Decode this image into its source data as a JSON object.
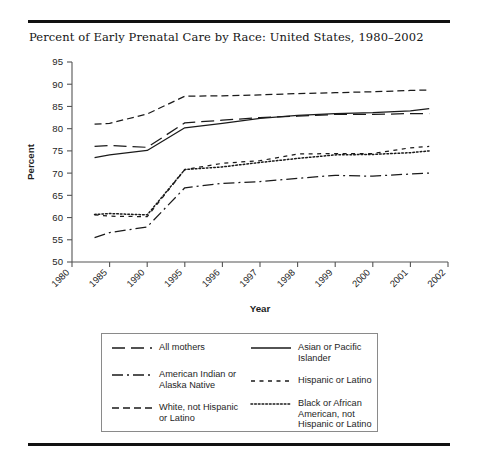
{
  "figure": {
    "title": "Percent of Early Prenatal Care by Race: United States, 1980–2002"
  },
  "chart_data": {
    "type": "line",
    "title": "Percent of Early Prenatal Care by Race: United States, 1980–2002",
    "xlabel": "Year",
    "ylabel": "Percent",
    "ylim": [
      50,
      95
    ],
    "ytick_labels": [
      "50",
      "55",
      "60",
      "65",
      "70",
      "75",
      "80",
      "85",
      "90",
      "95"
    ],
    "yticks": [
      50,
      55,
      60,
      65,
      70,
      75,
      80,
      85,
      90,
      95
    ],
    "categories": [
      "1980",
      "1985",
      "1990",
      "1995",
      "1996",
      "1997",
      "1998",
      "1999",
      "2000",
      "2001",
      "2002"
    ],
    "x": [
      1980,
      1985,
      1990,
      1995,
      1996,
      1997,
      1998,
      1999,
      2000,
      2001,
      2002
    ],
    "grid": false,
    "legend_position": "below-plot",
    "data_x_start": 1983,
    "data_x_end": 2001.5,
    "series": [
      {
        "name": "All mothers",
        "style": "long-dash",
        "x": [
          1983,
          1985,
          1990,
          1995,
          1996,
          1997,
          1998,
          1999,
          2000,
          2001,
          2001.5
        ],
        "values": [
          76.0,
          76.2,
          75.8,
          81.3,
          81.9,
          82.5,
          82.8,
          83.2,
          83.2,
          83.4,
          83.4
        ]
      },
      {
        "name": "Asian or Pacific Islander",
        "style": "solid",
        "x": [
          1983,
          1985,
          1990,
          1995,
          1996,
          1997,
          1998,
          1999,
          2000,
          2001,
          2001.5
        ],
        "values": [
          73.5,
          74.1,
          75.1,
          80.2,
          81.2,
          82.3,
          83.0,
          83.4,
          83.6,
          84.0,
          84.5
        ]
      },
      {
        "name": "American Indian or Alaska Native",
        "style": "dash-dot",
        "x": [
          1983,
          1985,
          1990,
          1995,
          1996,
          1997,
          1998,
          1999,
          2000,
          2001,
          2001.5
        ],
        "values": [
          55.5,
          56.6,
          57.9,
          66.7,
          67.7,
          68.1,
          68.8,
          69.5,
          69.3,
          69.8,
          70.0
        ]
      },
      {
        "name": "Hispanic or Latino",
        "style": "dashed",
        "x": [
          1983,
          1985,
          1990,
          1995,
          1996,
          1997,
          1998,
          1999,
          2000,
          2001,
          2001.5
        ],
        "values": [
          60.6,
          60.3,
          60.2,
          70.8,
          72.2,
          72.8,
          74.3,
          74.4,
          74.4,
          75.7,
          76.0
        ]
      },
      {
        "name": "White, not Hispanic or Latino",
        "style": "medium-dash",
        "x": [
          1983,
          1985,
          1990,
          1995,
          1996,
          1997,
          1998,
          1999,
          2000,
          2001,
          2001.5
        ],
        "values": [
          81.0,
          81.2,
          83.3,
          87.3,
          87.4,
          87.6,
          87.9,
          88.1,
          88.3,
          88.6,
          88.7
        ]
      },
      {
        "name": "Black or African American, not Hispanic or Latino",
        "style": "dotted",
        "x": [
          1983,
          1985,
          1990,
          1995,
          1996,
          1997,
          1998,
          1999,
          2000,
          2001,
          2001.5
        ],
        "values": [
          60.7,
          60.9,
          60.6,
          70.8,
          71.4,
          72.4,
          73.3,
          74.1,
          74.2,
          74.6,
          75.0
        ]
      }
    ]
  },
  "legend": {
    "left_column": [
      {
        "label": "All mothers",
        "style": "long-dash"
      },
      {
        "label": "American Indian or\nAlaska Native",
        "style": "dash-dot"
      },
      {
        "label": "White, not Hispanic\nor Latino",
        "style": "medium-dash"
      }
    ],
    "right_column": [
      {
        "label": "Asian or Pacific\nIslander",
        "style": "solid"
      },
      {
        "label": "Hispanic or Latino",
        "style": "dashed"
      },
      {
        "label": "Black or African\nAmerican, not\nHispanic or Latino",
        "style": "dotted"
      }
    ]
  },
  "colors": {
    "line": "#1a1a1a",
    "axis": "#555555",
    "text": "#1e1e1e",
    "rule": "#111111",
    "legend_border": "#8a8a8a"
  }
}
